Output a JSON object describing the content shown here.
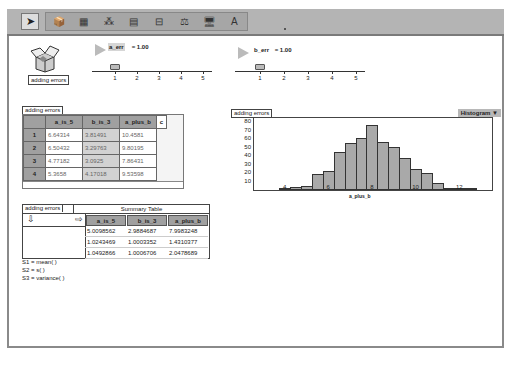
{
  "toolbar": {
    "tools": [
      {
        "name": "pointer-tool",
        "glyph": "➤"
      },
      {
        "name": "document-tool",
        "glyph": "📦"
      },
      {
        "name": "case-table-tool",
        "glyph": "▦"
      },
      {
        "name": "graph-tool",
        "glyph": "⁂"
      },
      {
        "name": "summary-table-tool",
        "glyph": "▤"
      },
      {
        "name": "slider-tool",
        "glyph": "⊟"
      },
      {
        "name": "scales-tool",
        "glyph": "⚖"
      },
      {
        "name": "computer-tool",
        "glyph": "🖥"
      },
      {
        "name": "text-tool",
        "glyph": "A"
      }
    ]
  },
  "document": {
    "label": "adding errors"
  },
  "sliders": [
    {
      "name": "a_err",
      "value_text": " = 1.00",
      "ticks": [
        "1",
        "2",
        "3",
        "4",
        "5"
      ]
    },
    {
      "name": "b_err",
      "value_text": " = 1.00",
      "ticks": [
        "1",
        "2",
        "3",
        "4",
        "5"
      ]
    }
  ],
  "case_table": {
    "tag": "adding errors",
    "columns": [
      "a_is_5",
      "b_is_3",
      "a_plus_b",
      "c"
    ],
    "rows": [
      {
        "index": "1",
        "values": [
          "6.64314",
          "3.81491",
          "10.4581"
        ]
      },
      {
        "index": "2",
        "values": [
          "6.50432",
          "3.29763",
          "9.80195"
        ]
      },
      {
        "index": "3",
        "values": [
          "4.77182",
          "3.0925",
          "7.86431"
        ]
      },
      {
        "index": "4",
        "values": [
          "5.3658",
          "4.17018",
          "9.53598"
        ]
      }
    ]
  },
  "graph": {
    "tag": "adding errors",
    "menu_label": "Histogram ▼"
  },
  "chart_data": {
    "type": "bar",
    "title": "",
    "xlabel": "a_plus_b",
    "ylabel": "",
    "bin_width": 0.5,
    "bin_starts": [
      3.75,
      4.25,
      4.75,
      5.25,
      5.75,
      6.25,
      6.75,
      7.25,
      7.75,
      8.25,
      8.75,
      9.25,
      9.75,
      10.25,
      10.75,
      11.25,
      11.75,
      12.25
    ],
    "values": [
      2,
      3,
      5,
      19,
      23,
      45,
      55,
      61,
      77,
      57,
      51,
      38,
      25,
      20,
      8,
      1,
      1,
      1
    ],
    "x_ticks": [
      "4",
      "6",
      "8",
      "10",
      "12"
    ],
    "y_ticks": [
      "10",
      "20",
      "30",
      "40",
      "50",
      "60",
      "70",
      "80"
    ],
    "xlim": [
      2.6,
      13.5
    ],
    "ylim": [
      0,
      85
    ],
    "grid": false,
    "legend": "none"
  },
  "summary_table": {
    "tag": "adding errors",
    "title": "Summary Table",
    "columns": [
      "a_is_5",
      "b_is_3",
      "a_plus_b"
    ],
    "rows": [
      [
        "5.0098562",
        "2.9884687",
        "7.9983248"
      ],
      [
        "1.0243469",
        "1.0003352",
        "1.4310377"
      ],
      [
        "1.0492866",
        "1.0006706",
        "2.0478689"
      ]
    ],
    "formulas": [
      "S1 = mean( )",
      "S2 = s( )",
      "S3 = variance( )"
    ]
  }
}
